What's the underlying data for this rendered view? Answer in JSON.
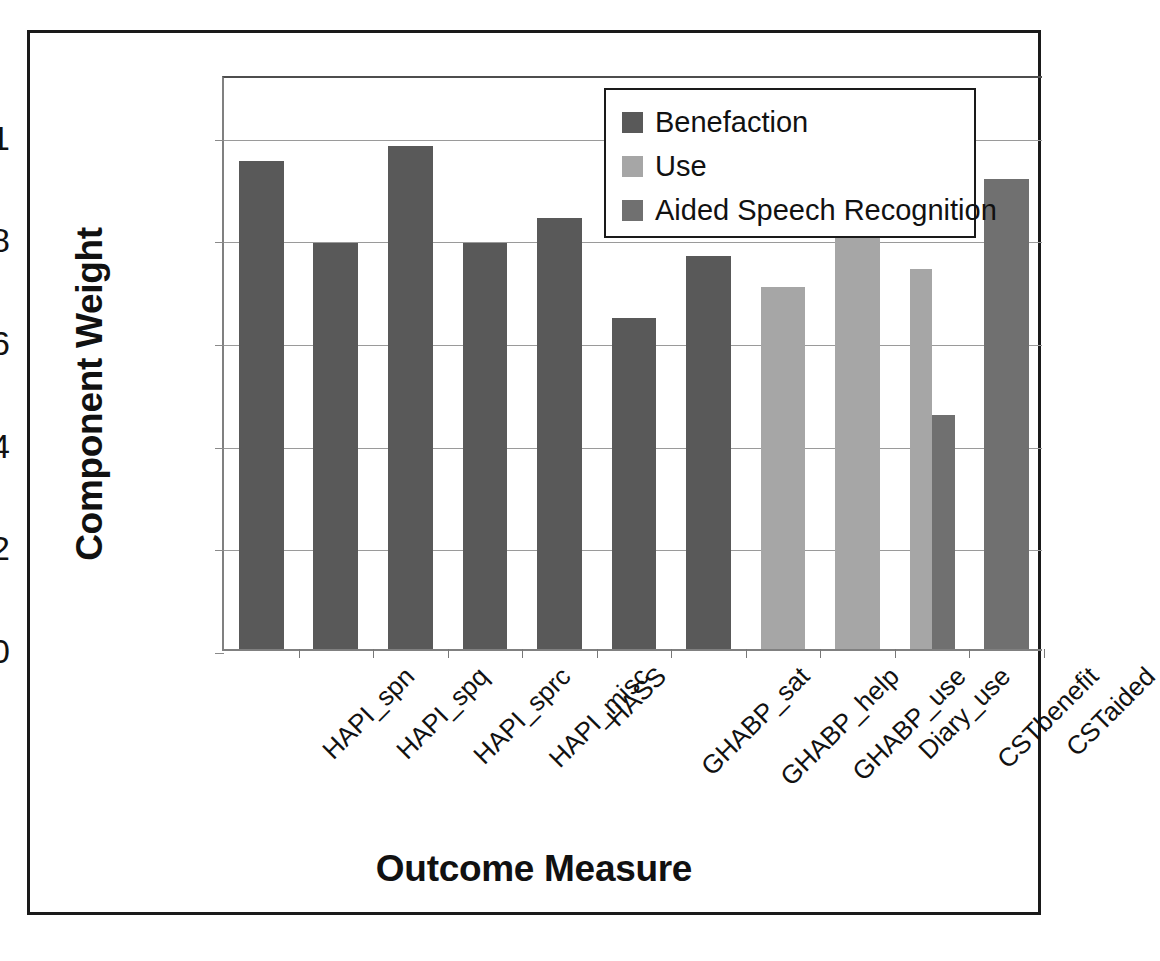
{
  "chart_data": {
    "type": "bar",
    "title": "",
    "xlabel": "Outcome Measure",
    "ylabel": "Component Weight",
    "ylim": [
      0,
      1.12
    ],
    "yticks": [
      0,
      0.2,
      0.4,
      0.6,
      0.8,
      1
    ],
    "ytick_labels": [
      "0",
      "0.2",
      "0.4",
      "0.6",
      "0.8",
      "1"
    ],
    "grid": "horizontal",
    "legend_position": "top-right-inside",
    "categories": [
      "HAPI_spn",
      "HAPI_spq",
      "HAPI_sprc",
      "HAPI_misc",
      "HASS",
      "GHABP_sat",
      "GHABP_help",
      "GHABP_use",
      "Diary_use",
      "CSTbenefit",
      "CSTaided"
    ],
    "series": [
      {
        "name": "Benefaction",
        "color": "#595959",
        "values": [
          0.95,
          0.79,
          0.98,
          0.79,
          0.84,
          0.645,
          0.765,
          null,
          null,
          null,
          null
        ]
      },
      {
        "name": "Use",
        "color": "#a6a6a6",
        "values": [
          null,
          null,
          null,
          null,
          null,
          null,
          null,
          0.705,
          0.8,
          0.74,
          null
        ]
      },
      {
        "name": "Aided Speech Recognition",
        "color": "#707070",
        "values": [
          null,
          null,
          null,
          null,
          null,
          null,
          null,
          null,
          null,
          0.455,
          0.915
        ]
      }
    ]
  },
  "axes": {
    "y_title": "Component Weight",
    "x_title": "Outcome Measure"
  },
  "legend": {
    "items": [
      {
        "label": "Benefaction",
        "color": "#595959"
      },
      {
        "label": "Use",
        "color": "#a6a6a6"
      },
      {
        "label": "Aided Speech Recognition",
        "color": "#707070"
      }
    ]
  },
  "colors": {
    "benefaction": "#595959",
    "use": "#a6a6a6",
    "aided_speech_recognition": "#707070",
    "gridline": "#9a9a9a",
    "frame": "#1a1a1a",
    "text": "#111111"
  }
}
